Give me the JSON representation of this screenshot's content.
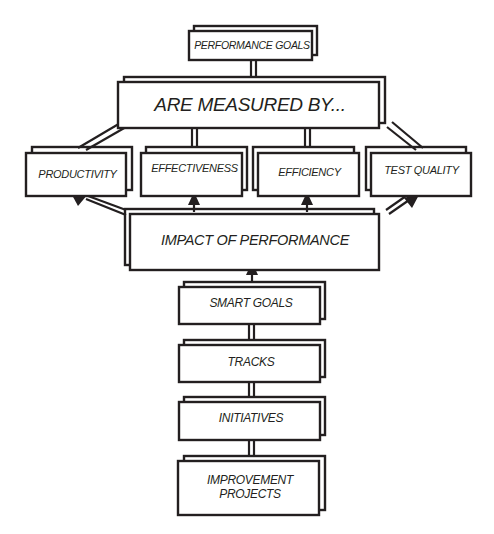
{
  "diagram": {
    "colors": {
      "stroke": "#231f20",
      "background": "#ffffff",
      "text": "#231f20"
    },
    "nodes": {
      "performance_goals": "PERFORMANCE GOALS",
      "are_measured_by": "ARE MEASURED BY...",
      "productivity": "PRODUCTIVITY",
      "effectiveness": "EFFECTIVENESS",
      "efficiency": "EFFICIENCY",
      "test_quality": "TEST QUALITY",
      "impact_of_performance": "IMPACT OF PERFORMANCE",
      "smart_goals": "SMART GOALS",
      "tracks": "TRACKS",
      "initiatives": "INITIATIVES",
      "improvement_projects": "IMPROVEMENT\nPROJECTS"
    },
    "edges": [
      {
        "from": "performance_goals",
        "to": "are_measured_by",
        "arrow": false
      },
      {
        "from": "are_measured_by",
        "to": "productivity",
        "arrow": false
      },
      {
        "from": "are_measured_by",
        "to": "effectiveness",
        "arrow": false
      },
      {
        "from": "are_measured_by",
        "to": "efficiency",
        "arrow": false
      },
      {
        "from": "are_measured_by",
        "to": "test_quality",
        "arrow": false
      },
      {
        "from": "impact_of_performance",
        "to": "productivity",
        "arrow": true
      },
      {
        "from": "impact_of_performance",
        "to": "effectiveness",
        "arrow": true
      },
      {
        "from": "impact_of_performance",
        "to": "efficiency",
        "arrow": true
      },
      {
        "from": "impact_of_performance",
        "to": "test_quality",
        "arrow": true
      },
      {
        "from": "smart_goals",
        "to": "impact_of_performance",
        "arrow": true
      },
      {
        "from": "tracks",
        "to": "smart_goals",
        "arrow": false
      },
      {
        "from": "initiatives",
        "to": "tracks",
        "arrow": false
      },
      {
        "from": "improvement_projects",
        "to": "initiatives",
        "arrow": false
      }
    ]
  }
}
